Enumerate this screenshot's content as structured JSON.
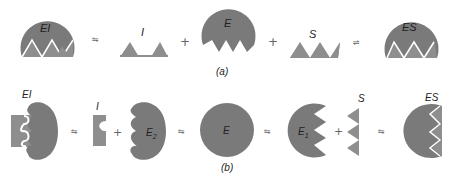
{
  "colors": {
    "enzyme": "#7a7a7a",
    "ligand": "#8e8e8e",
    "background": "#ffffff",
    "text": "#222222"
  },
  "panel_a": {
    "caption": "(a)",
    "species": [
      {
        "id": "EI",
        "label": "EI"
      },
      {
        "id": "I",
        "label": "I"
      },
      {
        "id": "E",
        "label": "E"
      },
      {
        "id": "S",
        "label": "S"
      },
      {
        "id": "ES",
        "label": "ES"
      }
    ],
    "operators": [
      "⇋",
      "+",
      "+",
      "⇌"
    ]
  },
  "panel_b": {
    "caption": "(b)",
    "species": [
      {
        "id": "EI",
        "label": "EI"
      },
      {
        "id": "I",
        "label": "I"
      },
      {
        "id": "E2",
        "label": "E",
        "subscript": "2"
      },
      {
        "id": "E",
        "label": "E"
      },
      {
        "id": "E1",
        "label": "E",
        "subscript": "1"
      },
      {
        "id": "S",
        "label": "S"
      },
      {
        "id": "ES",
        "label": "ES"
      }
    ],
    "operators": [
      "⇋",
      "+",
      "⇋",
      "⇋",
      "+",
      "⇋"
    ]
  }
}
